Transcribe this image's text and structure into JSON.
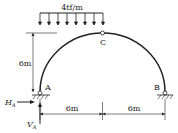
{
  "diagram": {
    "type": "three-hinged semicircular arch",
    "load": {
      "label": "4tf/m",
      "type": "uniformly distributed",
      "arrows": 8
    },
    "points": {
      "A": "A",
      "B": "B",
      "C": "C"
    },
    "dimensions": {
      "height": "6m",
      "left_span": "6m",
      "right_span": "6m"
    },
    "reactions": {
      "horizontal": "H",
      "horizontal_sub": "A",
      "vertical": "V",
      "vertical_sub": "A"
    },
    "colors": {
      "line": "#222222",
      "background": "#ffffff"
    }
  }
}
